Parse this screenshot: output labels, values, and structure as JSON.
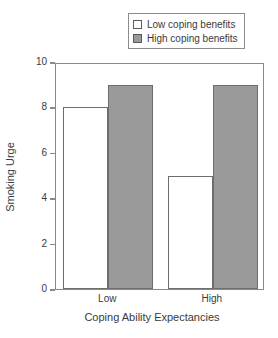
{
  "chart_data": {
    "type": "bar",
    "title": "",
    "subtitle": "",
    "xlabel": "Coping Ability Expectancies",
    "ylabel": "Smoking Urge",
    "categories": [
      "Low",
      "High"
    ],
    "series": [
      {
        "name": "Low coping benefits",
        "values": [
          8,
          5
        ],
        "color": "#ffffff"
      },
      {
        "name": "High coping benefits",
        "values": [
          9,
          9
        ],
        "color": "#9a9a9a"
      }
    ],
    "ylim": [
      0,
      10
    ],
    "yticks": [
      0,
      2,
      4,
      6,
      8,
      10
    ],
    "ytick_labels": [
      "0",
      "2",
      "4",
      "6",
      "8",
      "10"
    ],
    "grid": false,
    "legend_position": "top-right",
    "annotations": []
  },
  "legend": {
    "entries": [
      {
        "label": "Low coping benefits",
        "swatch": "white-square-swatch"
      },
      {
        "label": "High coping benefits",
        "swatch": "gray-square-swatch"
      }
    ]
  },
  "axes": {
    "y_title": "Smoking Urge",
    "x_title": "Coping Ability Expectancies",
    "y_tick_labels": [
      "10",
      "8",
      "6",
      "4",
      "2",
      "0"
    ],
    "x_tick_labels": [
      "Low",
      "High"
    ]
  }
}
